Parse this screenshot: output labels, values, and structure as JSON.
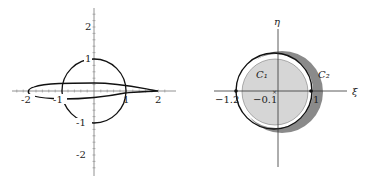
{
  "left_plot": {
    "description": "Airfoil (Joukowski) and unit circle in the z-plane",
    "x_tick_labels": [
      "-2",
      "-1",
      "1",
      "2"
    ],
    "y_tick_labels": [
      "2",
      "1",
      "-1",
      "-2"
    ],
    "curves": [
      "unit circle",
      "airfoil"
    ]
  },
  "right_plot": {
    "description": "Circles C1 and C2 in the zeta-plane",
    "x_axis_label": "ξ",
    "y_axis_label": "η",
    "circle_labels": [
      "C₁",
      "C₂"
    ],
    "point_labels": [
      "−1.2",
      "−0.1",
      "1"
    ],
    "colors": {
      "c2_fill": "#8a8a8a",
      "c1_fill": "#d6d6d6",
      "outline": "#111111"
    }
  }
}
